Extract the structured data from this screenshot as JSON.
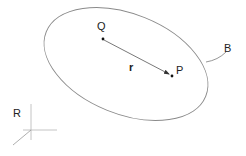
{
  "diagram": {
    "type": "vector-geometry",
    "body": {
      "label": "B",
      "shape": "ellipse",
      "center": [
        126,
        64
      ],
      "rx": 86,
      "ry": 50,
      "rotation_deg": 22,
      "stroke": "#8a8a8a"
    },
    "points": [
      {
        "id": "Q",
        "label": "Q",
        "x": 103,
        "y": 39
      },
      {
        "id": "P",
        "label": "P",
        "x": 172,
        "y": 76
      }
    ],
    "vector": {
      "label": "r",
      "from": "Q",
      "to": "P",
      "stroke": "#555555"
    },
    "reference_frame": {
      "label": "R",
      "origin": [
        31,
        130
      ]
    },
    "colors": {
      "line": "#8a8a8a",
      "text": "#222222",
      "point": "#111111",
      "axis": "#b5b5b5"
    }
  }
}
